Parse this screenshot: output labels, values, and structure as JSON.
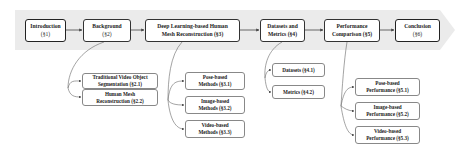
{
  "colors": {
    "band": "#ebebeb",
    "box_border": "#333333",
    "sub_border": "#888888",
    "line": "#555555",
    "text": "#222222"
  },
  "main_sections": [
    {
      "id": "intro",
      "line1": "Introduction",
      "line2": "(§1)"
    },
    {
      "id": "background",
      "line1": "Background",
      "line2": "(§2)"
    },
    {
      "id": "dl-hmr",
      "line1": "Deep Learning-based Human",
      "line2": "Mesh Reconstruction (§3)"
    },
    {
      "id": "datasets-metrics",
      "line1": "Datasets and",
      "line2": "Metrics (§4)"
    },
    {
      "id": "performance",
      "line1": "Performance",
      "line2": "Comparison (§5)"
    },
    {
      "id": "conclusion",
      "line1": "Conclusion",
      "line2": "(§6)"
    }
  ],
  "subsections": {
    "background": [
      {
        "line1": "Traditional Video Object",
        "line2": "Segmentation (§2.1)"
      },
      {
        "line1": "Human Mesh",
        "line2": "Reconstruction (§2.2)"
      }
    ],
    "dl_hmr": [
      {
        "line1": "Pose-based",
        "line2": "Methods (§3.1)"
      },
      {
        "line1": "Image-based",
        "line2": "Methods (§3.2)"
      },
      {
        "line1": "Video-based",
        "line2": "Methods (§3.3)"
      }
    ],
    "datasets_metrics": [
      {
        "line1": "Datasets (§4.1)"
      },
      {
        "line1": "Metrics (§4.2)"
      }
    ],
    "performance": [
      {
        "line1": "Pose-based",
        "line2": "Performance (§5.1)"
      },
      {
        "line1": "Image-based",
        "line2": "Performance (§5.2)"
      },
      {
        "line1": "Video-based",
        "line2": "Performance (§5.3)"
      }
    ]
  }
}
